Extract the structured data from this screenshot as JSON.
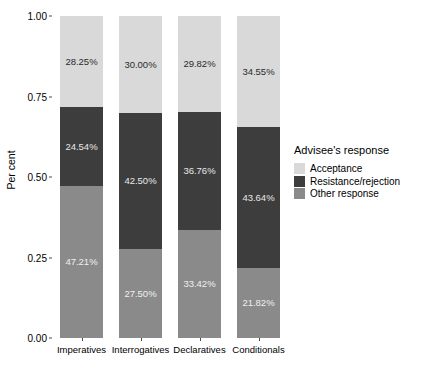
{
  "chart_data": {
    "type": "bar",
    "stacked": true,
    "stack_mode": "percent",
    "title": "",
    "xlabel": "",
    "ylabel": "Per cent",
    "ylim": [
      0,
      1
    ],
    "ytick_labels": [
      "0.00",
      "0.25",
      "0.50",
      "0.75",
      "1.00"
    ],
    "ytick_values": [
      0,
      0.25,
      0.5,
      0.75,
      1
    ],
    "grid": false,
    "legend_position": "right",
    "legend_title": "Advisee's response",
    "categories": [
      "Imperatives",
      "Interrogatives",
      "Declaratives",
      "Conditionals"
    ],
    "series": [
      {
        "name": "Acceptance",
        "color": "#d9d9d9",
        "values": [
          28.25,
          30.0,
          29.82,
          34.55
        ],
        "labels": [
          "28.25%",
          "30.00%",
          "29.82%",
          "34.55%"
        ]
      },
      {
        "name": "Resistance/rejection",
        "color": "#3d3d3d",
        "values": [
          24.54,
          42.5,
          36.76,
          43.64
        ],
        "labels": [
          "24.54%",
          "42.50%",
          "36.76%",
          "43.64%"
        ]
      },
      {
        "name": "Other response",
        "color": "#8a8a8a",
        "values": [
          47.21,
          27.5,
          33.42,
          21.82
        ],
        "labels": [
          "47.21%",
          "27.50%",
          "33.42%",
          "21.82%"
        ]
      }
    ],
    "stack_order_bottom_to_top": [
      "Other response",
      "Resistance/rejection",
      "Acceptance"
    ]
  }
}
